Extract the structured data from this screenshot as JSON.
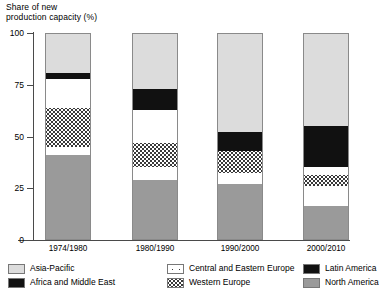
{
  "chart_data": {
    "type": "bar",
    "subtype": "stacked-bar-100",
    "title": "Share of new\nproduction capacity (%)",
    "xlabel": "",
    "ylabel": "Share of new production capacity (%)",
    "ylim": [
      0,
      100
    ],
    "yticks": [
      0,
      25,
      50,
      75,
      100
    ],
    "ytick_labels": [
      "0",
      "25",
      "50",
      "75",
      "100"
    ],
    "grid": false,
    "legend_position": "bottom",
    "categories": [
      "1974/1980",
      "1980/1990",
      "1990/2000",
      "2000/2010"
    ],
    "stack_order_bottom_to_top": [
      "North America",
      "Africa and Middle East",
      "Western Europe",
      "Central and Eastern Europe",
      "Latin America",
      "Asia-Pacific"
    ],
    "series": [
      {
        "name": "North America",
        "pattern": "solid-mid-gray",
        "color": "#9a9a9a",
        "values": [
          41,
          29,
          27,
          16
        ]
      },
      {
        "name": "Africa and Middle East",
        "pattern": "solid-black",
        "color": "#111111",
        "values": [
          4,
          6,
          5,
          10
        ]
      },
      {
        "name": "Western Europe",
        "pattern": "dense-dots",
        "color": "#3a3a3a",
        "values": [
          19,
          12,
          11,
          5
        ]
      },
      {
        "name": "Central and Eastern Europe",
        "pattern": "sparse-dots",
        "color": "#3a3a3a",
        "values": [
          14,
          16,
          0,
          4
        ]
      },
      {
        "name": "Latin America",
        "pattern": "solid-black",
        "color": "#111111",
        "values": [
          3,
          10,
          9,
          20
        ]
      },
      {
        "name": "Asia-Pacific",
        "pattern": "solid-light-gray",
        "color": "#dcdcdc",
        "values": [
          19,
          27,
          48,
          45
        ]
      }
    ]
  },
  "legend": {
    "items": [
      {
        "label": "Asia-Pacific",
        "key": "asia-pacific"
      },
      {
        "label": "Africa and Middle East",
        "key": "africa-middle-east"
      },
      {
        "label": "Central and Eastern Europe",
        "key": "central-eastern-europe"
      },
      {
        "label": "Western Europe",
        "key": "western-europe"
      },
      {
        "label": "Latin America",
        "key": "latin-america"
      },
      {
        "label": "North America",
        "key": "north-america"
      }
    ]
  }
}
